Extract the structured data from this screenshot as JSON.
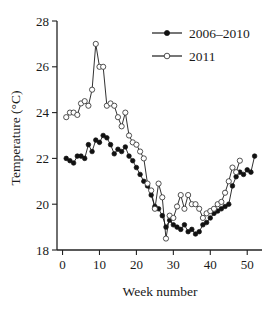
{
  "chart_data": {
    "type": "line",
    "title": "",
    "xlabel": "Week number",
    "ylabel": "Temperature (°C)",
    "xlim": [
      -1.5,
      54
    ],
    "ylim": [
      18,
      28
    ],
    "xticks": [
      0,
      10,
      20,
      30,
      40,
      50
    ],
    "xticklabels": [
      "0",
      "10",
      "20",
      "30",
      "40",
      "50"
    ],
    "yticks": [
      18,
      20,
      22,
      24,
      26,
      28
    ],
    "yticklabels": [
      "18",
      "20",
      "22",
      "24",
      "26",
      "28"
    ],
    "grid": false,
    "legend_position": "top-right",
    "series": [
      {
        "name": "2006–2010",
        "marker": "filled-circle",
        "color": "#111111",
        "x": [
          1,
          2,
          3,
          4,
          5,
          6,
          7,
          8,
          9,
          10,
          11,
          12,
          13,
          14,
          15,
          16,
          17,
          18,
          19,
          20,
          21,
          22,
          23,
          24,
          25,
          26,
          27,
          28,
          29,
          30,
          31,
          32,
          33,
          34,
          35,
          36,
          37,
          38,
          39,
          40,
          41,
          42,
          43,
          44,
          45,
          46,
          47,
          48,
          49,
          50,
          51,
          52
        ],
        "values": [
          22.0,
          21.9,
          21.8,
          22.1,
          22.1,
          22.0,
          22.6,
          22.3,
          22.8,
          22.7,
          23.0,
          22.9,
          22.6,
          22.2,
          22.4,
          22.3,
          22.5,
          22.1,
          21.9,
          21.6,
          21.3,
          21.0,
          20.8,
          20.4,
          19.9,
          19.8,
          19.5,
          19.0,
          19.3,
          19.1,
          19.0,
          18.9,
          19.1,
          18.8,
          18.9,
          18.7,
          18.8,
          19.1,
          19.2,
          19.4,
          19.6,
          19.7,
          19.8,
          19.9,
          20.0,
          20.8,
          21.2,
          21.4,
          21.3,
          21.5,
          21.4,
          22.1
        ]
      },
      {
        "name": "2011",
        "marker": "open-circle",
        "color": "#333333",
        "x": [
          1,
          2,
          3,
          4,
          5,
          6,
          7,
          8,
          9,
          10,
          11,
          12,
          13,
          14,
          15,
          16,
          17,
          18,
          19,
          20,
          21,
          22,
          23,
          24,
          25,
          26,
          27,
          28,
          29,
          30,
          31,
          32,
          33,
          34,
          35,
          36,
          37,
          38,
          39,
          40,
          41,
          42,
          43,
          44,
          45,
          46,
          47,
          48
        ],
        "values": [
          23.8,
          24.0,
          24.0,
          23.9,
          24.4,
          24.5,
          24.3,
          25.0,
          27.0,
          26.0,
          26.0,
          24.3,
          24.4,
          24.3,
          23.8,
          23.4,
          24.0,
          23.0,
          22.7,
          22.6,
          22.3,
          22.0,
          20.9,
          20.6,
          19.8,
          20.9,
          20.3,
          18.5,
          19.5,
          19.4,
          19.9,
          20.4,
          19.8,
          20.4,
          20.0,
          20.0,
          19.8,
          19.4,
          19.6,
          19.7,
          19.8,
          20.0,
          20.1,
          20.5,
          21.0,
          21.6,
          21.4,
          21.9
        ]
      }
    ]
  },
  "legend": {
    "entries": [
      {
        "label": "2006–2010"
      },
      {
        "label": "2011"
      }
    ]
  },
  "axes": {
    "x_title": "Week number",
    "y_title": "Temperature (°C)"
  }
}
